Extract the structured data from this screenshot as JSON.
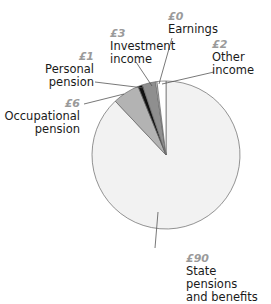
{
  "chart_data": {
    "type": "pie",
    "title": "",
    "unit": "£",
    "slices": [
      {
        "label": "State pensions and benefits",
        "value_label": "£90",
        "value": 90,
        "color": "#f2f2f2"
      },
      {
        "label": "Occupational pension",
        "value_label": "£6",
        "value": 6,
        "color": "#b3b3b3"
      },
      {
        "label": "Personal pension",
        "value_label": "£1",
        "value": 1,
        "color": "#111111"
      },
      {
        "label": "Investment income",
        "value_label": "£3",
        "value": 3,
        "color": "#8f8f8f"
      },
      {
        "label": "Earnings",
        "value_label": "£0",
        "value": 0.3,
        "color": "#ffffff"
      },
      {
        "label": "Other income",
        "value_label": "£2",
        "value": 2,
        "color": "#ffffff"
      }
    ],
    "center": [
      166,
      155
    ],
    "radius": 74,
    "start_angle_deg": 0,
    "direction": "clockwise",
    "legend": "none (callout labels)"
  },
  "labels": {
    "earnings": {
      "value": "£0",
      "name": "Earnings"
    },
    "investment": {
      "value": "£3",
      "name1": "Investment",
      "name2": "income"
    },
    "other": {
      "value": "£2",
      "name1": "Other",
      "name2": "income"
    },
    "personal": {
      "value": "£1",
      "name1": "Personal",
      "name2": "pension"
    },
    "occupational": {
      "value": "£6",
      "name1": "Occupational",
      "name2": "pension"
    },
    "state": {
      "value": "£90",
      "name1": "State pensions",
      "name2": "and benefits"
    }
  }
}
